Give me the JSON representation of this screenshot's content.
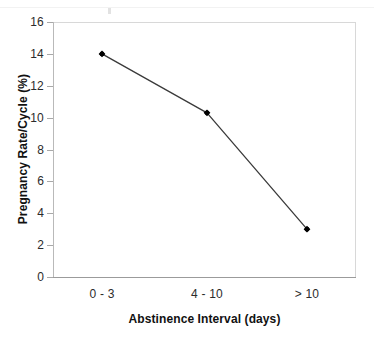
{
  "chart_data": {
    "type": "line",
    "title": "",
    "subtitle": "",
    "xlabel": "Abstinence Interval (days)",
    "ylabel": "Pregnancy Rate/Cycle (%)",
    "categories": [
      "0 - 3",
      "4 - 10",
      "> 10"
    ],
    "values": [
      14.0,
      10.3,
      3.0
    ],
    "series": [
      {
        "name": "Pregnancy Rate/Cycle (%)",
        "values": [
          14.0,
          10.3,
          3.0
        ],
        "marker": "filled-diamond",
        "line_color": "#3a3a3a",
        "marker_color": "#000000"
      }
    ],
    "ylim": [
      0,
      16
    ],
    "ytick_values": [
      0,
      2,
      4,
      6,
      8,
      10,
      12,
      14,
      16
    ],
    "ytick_labels": [
      "0",
      "2",
      "4",
      "6",
      "8",
      "10",
      "12",
      "14",
      "16"
    ],
    "xtick_labels": [
      "0 - 3",
      "4 - 10",
      "> 10"
    ],
    "grid": false,
    "legend": false,
    "legend_position": "none",
    "annotations": []
  },
  "axes": {
    "y_title": "Pregnancy Rate/Cycle (%)",
    "x_title": "Abstinence Interval (days)"
  },
  "colors": {
    "line": "#3a3a3a",
    "marker": "#000000",
    "axis": "#9b9b9b",
    "border": "#d8d8d8",
    "tick_text": "#2b2b2b",
    "title_text": "#111111",
    "background": "#ffffff"
  }
}
